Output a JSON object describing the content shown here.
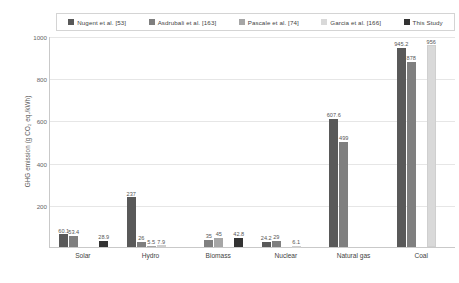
{
  "chart_data": {
    "type": "bar",
    "title": "",
    "xlabel": "",
    "ylabel": "GHG emission (g CO₂ eq./kWh)",
    "ylim": [
      0,
      1000
    ],
    "yticks": [
      0,
      200,
      400,
      600,
      800,
      1000
    ],
    "ytick_labels": [
      "0",
      "200",
      "400",
      "600",
      "800",
      "1000"
    ],
    "grid": true,
    "legend_position": "top",
    "categories": [
      "Solar",
      "Hydro",
      "Biomass",
      "Nuclear",
      "Natural gas",
      "Coal"
    ],
    "series": [
      {
        "name": "Nugent et al. [53]",
        "color": "#595959",
        "values": [
          60.1,
          237,
          null,
          24.2,
          607.6,
          945.2
        ],
        "labels": [
          "60.1",
          "237",
          "",
          "24.2",
          "607.6",
          "945.2"
        ]
      },
      {
        "name": "Asdrubali et al. [163]",
        "color": "#7f7f7f",
        "values": [
          53.4,
          26,
          35,
          29,
          499,
          878
        ],
        "labels": [
          "53.4",
          "26",
          "35",
          "29",
          "499",
          "878"
        ]
      },
      {
        "name": "Pascale et al. [74]",
        "color": "#a6a6a6",
        "values": [
          null,
          5.5,
          45,
          null,
          null,
          null
        ],
        "labels": [
          "",
          "5.5",
          "45",
          "",
          "",
          ""
        ]
      },
      {
        "name": "Garcia et al. [166]",
        "color": "#d9d9d9",
        "values": [
          null,
          7.9,
          null,
          6.1,
          null,
          956
        ],
        "labels": [
          "",
          "7.9",
          "",
          "6.1",
          "",
          "956"
        ]
      },
      {
        "name": "This Study",
        "color": "#333333",
        "values": [
          28.9,
          null,
          42.8,
          null,
          null,
          null
        ],
        "labels": [
          "28.9",
          "",
          "42.8",
          "",
          "",
          ""
        ]
      }
    ]
  }
}
